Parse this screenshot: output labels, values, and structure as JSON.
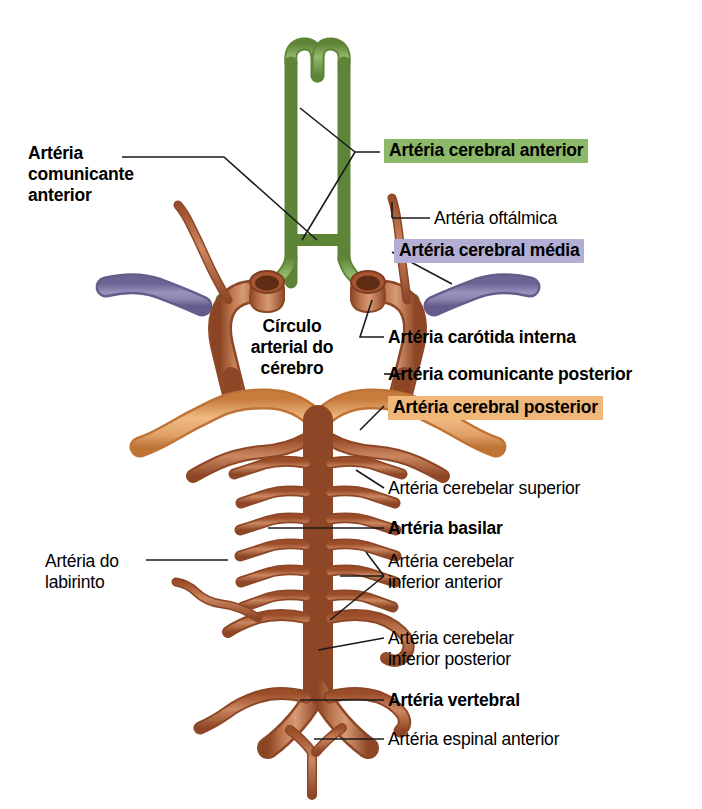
{
  "figure": {
    "language": "pt-BR",
    "background_color": "#ffffff"
  },
  "palette": {
    "anterior_cerebral_green": "#6f9a43",
    "anterior_cerebral_green_light": "#9dbf72",
    "middle_cerebral_purple": "#8379a8",
    "middle_cerebral_purple_light": "#a89fc4",
    "posterior_cerebral_orange": "#d98c47",
    "posterior_cerebral_orange_light": "#edb77f",
    "artery_brown": "#a65632",
    "artery_brown_light": "#c8815c",
    "artery_brown_dark": "#7e3d20",
    "lumen_dark": "#6b3418",
    "leader_line": "#1a1a1a",
    "text": "#000000",
    "highlight_green": "#8cb86a",
    "highlight_purple": "#b3aed4",
    "highlight_orange": "#f0b878"
  },
  "labels": [
    {
      "id": "arteria-comunicante-anterior",
      "text": "Artéria\ncomunicante\nanterior",
      "style": "bold",
      "highlight": "none",
      "align": "left",
      "x": 28,
      "y": 143
    },
    {
      "id": "arteria-cerebral-anterior",
      "text": "Artéria cerebral anterior",
      "style": "bold",
      "highlight": "green",
      "align": "left",
      "x": 384,
      "y": 139
    },
    {
      "id": "arteria-oftalmica",
      "text": "Artéria oftálmica",
      "style": "regular",
      "highlight": "none",
      "align": "left",
      "x": 434,
      "y": 208
    },
    {
      "id": "arteria-cerebral-media",
      "text": "Artéria cerebral média",
      "style": "bold",
      "highlight": "purple",
      "align": "left",
      "x": 394,
      "y": 239
    },
    {
      "id": "circulo-arterial-do-cerebro",
      "text": "Círculo\narterial do\ncérebro",
      "style": "bold",
      "highlight": "none",
      "align": "center",
      "x": 228,
      "y": 316
    },
    {
      "id": "arteria-carotida-interna",
      "text": "Artéria carótida interna",
      "style": "bold",
      "highlight": "none",
      "align": "left",
      "x": 388,
      "y": 327
    },
    {
      "id": "arteria-comunicante-posterior",
      "text": "Artéria comunicante posterior",
      "style": "bold",
      "highlight": "none",
      "align": "left",
      "x": 388,
      "y": 364
    },
    {
      "id": "arteria-cerebral-posterior",
      "text": "Artéria cerebral posterior",
      "style": "bold",
      "highlight": "orange",
      "align": "left",
      "x": 388,
      "y": 396
    },
    {
      "id": "arteria-cerebelar-superior",
      "text": "Artéria cerebelar superior",
      "style": "regular",
      "highlight": "none",
      "align": "left",
      "x": 388,
      "y": 478
    },
    {
      "id": "arteria-basilar",
      "text": "Artéria basilar",
      "style": "bold",
      "highlight": "none",
      "align": "left",
      "x": 388,
      "y": 518
    },
    {
      "id": "arteria-cerebelar-inferior-anterior",
      "text": "Artéria cerebelar\ninferior anterior",
      "style": "regular",
      "highlight": "none",
      "align": "left",
      "x": 388,
      "y": 551
    },
    {
      "id": "arteria-do-labirinto",
      "text": "Artéria do\nlabirinto",
      "style": "regular",
      "highlight": "none",
      "align": "left",
      "x": 45,
      "y": 551
    },
    {
      "id": "arteria-cerebelar-inferior-posterior",
      "text": "Artéria cerebelar\ninferior posterior",
      "style": "regular",
      "highlight": "none",
      "align": "left",
      "x": 388,
      "y": 628
    },
    {
      "id": "arteria-vertebral",
      "text": "Artéria vertebral",
      "style": "bold",
      "highlight": "none",
      "align": "left",
      "x": 388,
      "y": 690
    },
    {
      "id": "arteria-espinal-anterior",
      "text": "Artéria espinal anterior",
      "style": "regular",
      "highlight": "none",
      "align": "left",
      "x": 388,
      "y": 729
    }
  ],
  "structures": [
    {
      "id": "anterior-cerebral-artery",
      "color_group": "green",
      "label_ref": "arteria-cerebral-anterior"
    },
    {
      "id": "anterior-communicating-artery",
      "color_group": "green",
      "label_ref": "arteria-comunicante-anterior"
    },
    {
      "id": "middle-cerebral-artery",
      "color_group": "purple",
      "label_ref": "arteria-cerebral-media"
    },
    {
      "id": "internal-carotid-artery",
      "color_group": "brown",
      "label_ref": "arteria-carotida-interna"
    },
    {
      "id": "ophthalmic-artery",
      "color_group": "brown",
      "label_ref": "arteria-oftalmica"
    },
    {
      "id": "posterior-communicating-artery",
      "color_group": "brown",
      "label_ref": "arteria-comunicante-posterior"
    },
    {
      "id": "posterior-cerebral-artery",
      "color_group": "orange",
      "label_ref": "arteria-cerebral-posterior"
    },
    {
      "id": "superior-cerebellar-artery",
      "color_group": "brown",
      "label_ref": "arteria-cerebelar-superior"
    },
    {
      "id": "basilar-artery",
      "color_group": "brown",
      "label_ref": "arteria-basilar"
    },
    {
      "id": "pontine-branches",
      "color_group": "brown",
      "label_ref": null
    },
    {
      "id": "anterior-inferior-cerebellar-artery",
      "color_group": "brown",
      "label_ref": "arteria-cerebelar-inferior-anterior"
    },
    {
      "id": "labyrinthine-artery",
      "color_group": "brown",
      "label_ref": "arteria-do-labirinto"
    },
    {
      "id": "posterior-inferior-cerebellar-artery",
      "color_group": "brown",
      "label_ref": "arteria-cerebelar-inferior-posterior"
    },
    {
      "id": "vertebral-artery",
      "color_group": "brown",
      "label_ref": "arteria-vertebral"
    },
    {
      "id": "anterior-spinal-artery",
      "color_group": "brown",
      "label_ref": "arteria-espinal-anterior"
    }
  ]
}
